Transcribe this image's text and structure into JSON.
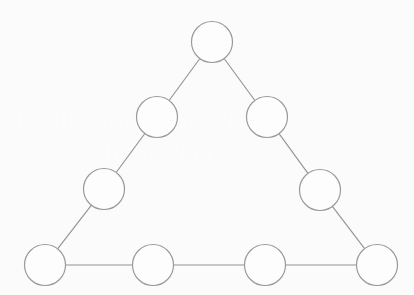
{
  "figure": {
    "name": "triangle-node-diagram",
    "width": 414,
    "height": 295,
    "background_color": "#fbfbfb",
    "node_fill_color": "#fdfdfd",
    "node_stroke_color": "#9a9a9a",
    "edge_stroke_color": "#949494",
    "node_count": 9,
    "edge_count": 9,
    "node_radius": 20.5
  },
  "ghost_text": {
    "note": "faint mirrored show-through from reverse side of page, illegible",
    "line_1": "Ilwlwt w owwluw ll",
    "line_2": "w pulw lw ulwy w"
  },
  "nodes": [
    {
      "id": "apex",
      "label": "",
      "cx": 212,
      "cy": 42,
      "r": 20.5,
      "role": "vertex-top"
    },
    {
      "id": "left-upper",
      "label": "",
      "cx": 157,
      "cy": 117,
      "r": 20.5,
      "role": "side-left"
    },
    {
      "id": "right-upper",
      "label": "",
      "cx": 267,
      "cy": 117,
      "r": 20.5,
      "role": "side-right"
    },
    {
      "id": "left-lower",
      "label": "",
      "cx": 104,
      "cy": 189,
      "r": 20.5,
      "role": "side-left"
    },
    {
      "id": "right-lower",
      "label": "",
      "cx": 320,
      "cy": 190,
      "r": 20.5,
      "role": "side-right"
    },
    {
      "id": "bottom-left",
      "label": "",
      "cx": 45,
      "cy": 265,
      "r": 20.5,
      "role": "vertex-bottom-left"
    },
    {
      "id": "bottom-mid-1",
      "label": "",
      "cx": 153,
      "cy": 265,
      "r": 20.5,
      "role": "side-bottom"
    },
    {
      "id": "bottom-mid-2",
      "label": "",
      "cx": 265,
      "cy": 265,
      "r": 20.5,
      "role": "side-bottom"
    },
    {
      "id": "bottom-right",
      "label": "",
      "cx": 377,
      "cy": 265,
      "r": 20.5,
      "role": "vertex-bottom-right"
    }
  ],
  "edges": [
    {
      "id": "edge-apex-left-upper",
      "from": "apex",
      "to": "left-upper"
    },
    {
      "id": "edge-left-upper-left-lower",
      "from": "left-upper",
      "to": "left-lower"
    },
    {
      "id": "edge-left-lower-bottom-left",
      "from": "left-lower",
      "to": "bottom-left"
    },
    {
      "id": "edge-apex-right-upper",
      "from": "apex",
      "to": "right-upper"
    },
    {
      "id": "edge-right-upper-right-lower",
      "from": "right-upper",
      "to": "right-lower"
    },
    {
      "id": "edge-right-lower-bottom-right",
      "from": "right-lower",
      "to": "bottom-right"
    },
    {
      "id": "edge-bottom-left-mid-1",
      "from": "bottom-left",
      "to": "bottom-mid-1"
    },
    {
      "id": "edge-bottom-mid-1-mid-2",
      "from": "bottom-mid-1",
      "to": "bottom-mid-2"
    },
    {
      "id": "edge-bottom-mid-2-right",
      "from": "bottom-mid-2",
      "to": "bottom-right"
    }
  ]
}
